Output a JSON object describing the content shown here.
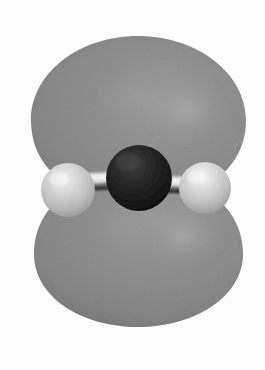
{
  "figure": {
    "kind": "molecular-orbital-render",
    "title": "",
    "caption": "",
    "width": 265,
    "height": 370,
    "background_color": "#fdfdfd",
    "has_text": false,
    "render_style": "ball-and-stick molecule enclosed in a translucent isosurface"
  },
  "colors": {
    "background": "#fdfdfd",
    "lobe_fill": "#8a8a8a",
    "lobe_shadow": "#6e6e6e",
    "lobe_highlight": "#a8a8a8",
    "lobe_edge": "#787878",
    "central_atom": "#1e1e1e",
    "central_atom_dark": "#0d0d0d",
    "central_atom_light": "#3a3a3a",
    "hydrogen_atom": "#c9c9c9",
    "hydrogen_highlight": "#efefef",
    "hydrogen_shadow": "#8f8f8f",
    "bond_bright": "#f2f2f2",
    "bond_shadow": "#202020",
    "seam_line": "#818181"
  },
  "orbital": {
    "name": "pi-type orbital isosurface",
    "lobe_count": 2,
    "lobes": [
      {
        "id": "upper-lobe",
        "position": "above molecular plane",
        "center_x": 138,
        "center_y": 118,
        "radius_x": 107,
        "radius_y": 84,
        "highlight_x": 186,
        "highlight_y": 110
      },
      {
        "id": "lower-lobe",
        "position": "below molecular plane",
        "center_x": 138,
        "center_y": 253,
        "radius_x": 104,
        "radius_y": 73,
        "highlight_x": 184,
        "highlight_y": 236
      }
    ],
    "waist_y": 190,
    "seam_x": 85
  },
  "molecule": {
    "formula": "H-X-H",
    "geometry": "linear",
    "atoms": [
      {
        "id": "central-atom",
        "element_role": "central heavy atom",
        "cx": 139,
        "cy": 178,
        "r": 33,
        "shade": "dark"
      },
      {
        "id": "hydrogen-left",
        "element_role": "terminal hydrogen",
        "cx": 68,
        "cy": 190,
        "r": 27,
        "shade": "light"
      },
      {
        "id": "hydrogen-right",
        "element_role": "terminal hydrogen",
        "cx": 205,
        "cy": 188,
        "r": 26,
        "shade": "light"
      }
    ],
    "bonds": [
      {
        "id": "bond-left",
        "from": "hydrogen-left",
        "to": "central-atom",
        "x1": 76,
        "y1": 184,
        "x2": 126,
        "y2": 179
      },
      {
        "id": "bond-right",
        "from": "central-atom",
        "to": "hydrogen-right",
        "x1": 153,
        "y1": 182,
        "x2": 198,
        "y2": 185
      }
    ]
  }
}
